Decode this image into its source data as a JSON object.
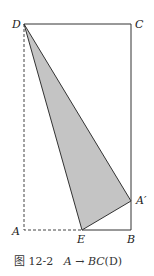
{
  "figure": {
    "labels": {
      "D": "D",
      "C": "C",
      "A": "A",
      "B": "B",
      "E": "E",
      "A_prime": "A′"
    },
    "caption": {
      "number": "图 12-2",
      "text_from": "A",
      "arrow": "→",
      "text_to": "BC",
      "suffix": "(D)"
    },
    "colors": {
      "stroke": "#333333",
      "fill": "#c4c4c4"
    }
  }
}
